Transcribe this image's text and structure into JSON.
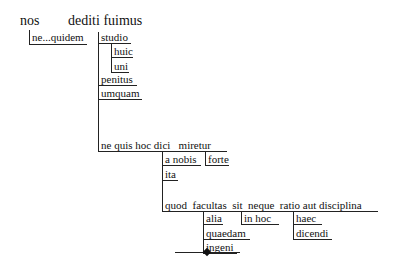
{
  "diagram": {
    "type": "sentence-diagram",
    "main_line": {
      "subject": "nos",
      "verb": "dediti fuimus"
    },
    "words": {
      "ne_quidem": "ne...quidem",
      "studio": "studio",
      "huic": "huic",
      "uni": "uni",
      "penitus": "penitus",
      "umquam": "umquam",
      "clause1": "ne quis hoc dici   miretur",
      "a_nobis": "a nobis",
      "forte": "forte",
      "ita": "ita",
      "clause2": "quod  facultas  sit  neque  ratio aut disciplina",
      "alia": "alia",
      "quaedam": "quaedam",
      "ingeni": "ingeni",
      "in_hoc": "in hoc",
      "haec": "haec",
      "dicendi": "dicendi"
    },
    "end_marker": "line-with-diamond"
  }
}
